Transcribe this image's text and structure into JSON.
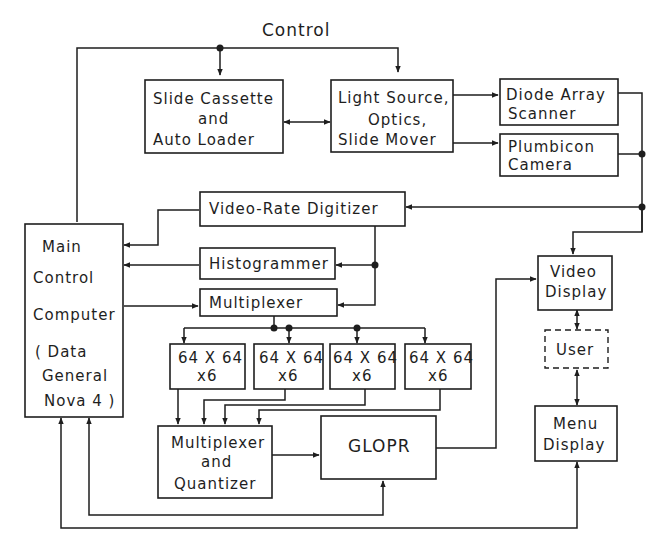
{
  "diagram": {
    "title": "Control",
    "blocks": {
      "slide_cassette": {
        "lines": [
          "Slide Cassette",
          "and",
          "Auto Loader"
        ]
      },
      "light_source": {
        "lines": [
          "Light Source,",
          "Optics,",
          "Slide Mover"
        ]
      },
      "diode_array": {
        "lines": [
          "Diode Array",
          "Scanner"
        ]
      },
      "plumbicon": {
        "lines": [
          "Plumbicon",
          "Camera"
        ]
      },
      "digitizer": {
        "lines": [
          "Video-Rate Digitizer"
        ]
      },
      "histogrammer": {
        "lines": [
          "Histogrammer"
        ]
      },
      "multiplexer": {
        "lines": [
          "Multiplexer"
        ]
      },
      "main_computer": {
        "lines": [
          "Main",
          "Control",
          "Computer",
          "( Data",
          "General",
          "Nova 4 )"
        ]
      },
      "memory_1": {
        "lines": [
          "64 X 64",
          "x6"
        ]
      },
      "memory_2": {
        "lines": [
          "64 X 64",
          "x6"
        ]
      },
      "memory_3": {
        "lines": [
          "64 X 64",
          "x6"
        ]
      },
      "memory_4": {
        "lines": [
          "64 X 64",
          "x6"
        ]
      },
      "mux_quantizer": {
        "lines": [
          "Multiplexer",
          "and",
          "Quantizer"
        ]
      },
      "glopr": {
        "lines": [
          "GLOPR"
        ]
      },
      "video_display": {
        "lines": [
          "Video",
          "Display"
        ]
      },
      "user": {
        "lines": [
          "User"
        ]
      },
      "menu_display": {
        "lines": [
          "Menu",
          "Display"
        ]
      }
    },
    "colors": {
      "ink": "#1e1e1e",
      "background": "#ffffff"
    }
  }
}
